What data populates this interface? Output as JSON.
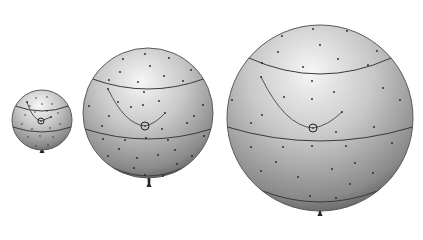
{
  "diagram": {
    "background": "#ffffff",
    "colors": {
      "shade_light": "#f4f4f4",
      "shade_mid": "#bdbdbd",
      "shade_dark": "#5a5a5a",
      "line": "#3a3a3a",
      "dot": "#222222"
    },
    "balloons": [
      {
        "id": "small",
        "cx": 42,
        "cy": 120,
        "r": 30,
        "bands": [
          {
            "dy": -14,
            "ry": 5
          },
          {
            "dy": 7,
            "ry": 5
          }
        ],
        "circled_dot": {
          "x": 41,
          "y": 121
        },
        "arc": {
          "from": [
            27,
            102
          ],
          "to": [
            51,
            117
          ]
        },
        "dots": [
          [
            36,
            98
          ],
          [
            47,
            97
          ],
          [
            30,
            106
          ],
          [
            42,
            104
          ],
          [
            52,
            104
          ],
          [
            25,
            115
          ],
          [
            35,
            112
          ],
          [
            47,
            111
          ],
          [
            58,
            113
          ],
          [
            22,
            124
          ],
          [
            32,
            129
          ],
          [
            50,
            128
          ],
          [
            60,
            124
          ],
          [
            28,
            137
          ],
          [
            40,
            136
          ],
          [
            53,
            137
          ],
          [
            36,
            146
          ],
          [
            48,
            145
          ]
        ],
        "tie": {
          "x": 42,
          "y": 150
        }
      },
      {
        "id": "medium",
        "cx": 148,
        "cy": 113,
        "r": 65,
        "bands": [
          {
            "dy": -34,
            "ry": 10
          },
          {
            "dy": 16,
            "ry": 10
          },
          {
            "dy": 55,
            "ry": 8
          }
        ],
        "circled_dot": {
          "x": 145,
          "y": 126
        },
        "arc": {
          "from": [
            108,
            89
          ],
          "to": [
            165,
            113
          ]
        },
        "dots": [
          [
            145,
            54
          ],
          [
            123,
            59
          ],
          [
            169,
            58
          ],
          [
            150,
            66
          ],
          [
            120,
            72
          ],
          [
            164,
            76
          ],
          [
            191,
            70
          ],
          [
            109,
            80
          ],
          [
            138,
            82
          ],
          [
            183,
            81
          ],
          [
            144,
            92
          ],
          [
            89,
            106
          ],
          [
            118,
            102
          ],
          [
            159,
            101
          ],
          [
            203,
            105
          ],
          [
            109,
            116
          ],
          [
            131,
            107
          ],
          [
            143,
            105
          ],
          [
            194,
            116
          ],
          [
            102,
            126
          ],
          [
            162,
            129
          ],
          [
            187,
            123
          ],
          [
            103,
            139
          ],
          [
            125,
            140
          ],
          [
            146,
            138
          ],
          [
            168,
            140
          ],
          [
            204,
            136
          ],
          [
            119,
            149
          ],
          [
            175,
            150
          ],
          [
            108,
            156
          ],
          [
            137,
            158
          ],
          [
            158,
            155
          ],
          [
            192,
            156
          ],
          [
            134,
            168
          ],
          [
            177,
            164
          ],
          [
            145,
            175
          ],
          [
            163,
            176
          ]
        ],
        "tie": {
          "x": 149,
          "y": 184
        }
      },
      {
        "id": "large",
        "cx": 320,
        "cy": 118,
        "r": 93,
        "bands": [
          {
            "dy": -60,
            "ry": 16
          },
          {
            "dy": 9,
            "ry": 14
          },
          {
            "dy": 73,
            "ry": 11
          }
        ],
        "circled_dot": {
          "x": 313,
          "y": 128
        },
        "arc": {
          "from": [
            261,
            77
          ],
          "to": [
            342,
            112
          ]
        },
        "dots": [
          [
            313,
            29
          ],
          [
            347,
            31
          ],
          [
            282,
            36
          ],
          [
            320,
            45
          ],
          [
            278,
            52
          ],
          [
            338,
            59
          ],
          [
            377,
            51
          ],
          [
            262,
            63
          ],
          [
            303,
            67
          ],
          [
            368,
            65
          ],
          [
            312,
            81
          ],
          [
            284,
            97
          ],
          [
            312,
            99
          ],
          [
            334,
            92
          ],
          [
            383,
            88
          ],
          [
            400,
            100
          ],
          [
            232,
            100
          ],
          [
            262,
            115
          ],
          [
            251,
            123
          ],
          [
            374,
            127
          ],
          [
            336,
            132
          ],
          [
            251,
            147
          ],
          [
            283,
            147
          ],
          [
            312,
            146
          ],
          [
            346,
            146
          ],
          [
            392,
            143
          ],
          [
            276,
            162
          ],
          [
            355,
            163
          ],
          [
            261,
            171
          ],
          [
            332,
            169
          ],
          [
            373,
            173
          ],
          [
            298,
            177
          ],
          [
            350,
            184
          ],
          [
            310,
            196
          ],
          [
            336,
            198
          ]
        ],
        "tie": {
          "x": 320,
          "y": 213
        }
      }
    ]
  }
}
